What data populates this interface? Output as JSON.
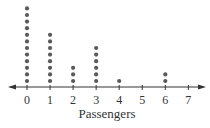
{
  "chart_data": {
    "type": "dot",
    "title": "",
    "xlabel": "Passengers",
    "ylabel": "",
    "categories": [
      "0",
      "1",
      "2",
      "3",
      "4",
      "5",
      "6",
      "7"
    ],
    "x": [
      0,
      1,
      2,
      3,
      4,
      5,
      6,
      7
    ],
    "values": [
      12,
      8,
      3,
      6,
      1,
      0,
      2,
      0
    ],
    "xlim": [
      0,
      7
    ],
    "grid": false,
    "legend": "none",
    "axis_arrows": "both"
  },
  "style": {
    "dot_color": "#5a5a5a",
    "axis_color": "#333333",
    "text_color": "#333333"
  }
}
